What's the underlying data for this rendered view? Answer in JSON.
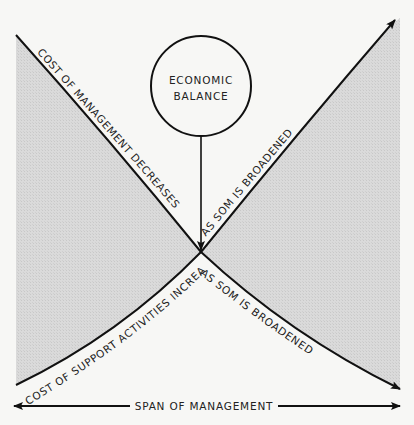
{
  "diagram": {
    "center_node": {
      "line1": "ECONOMIC",
      "line2": "BALANCE"
    },
    "curves": {
      "management_cost": {
        "label_first": "COST OF MANAGEMENT DECREASES",
        "label_second": "AS SOM IS BROADENED"
      },
      "support_cost": {
        "label_first": "COST OF SUPPORT ACTIVITIES INCREASES",
        "label_second": "AS SOM IS BROADENED"
      }
    },
    "axis": {
      "label": "SPAN OF MANAGEMENT"
    },
    "colors": {
      "shade": "#d6d6d6",
      "line": "#111111",
      "background": "#f7f7f5"
    }
  }
}
